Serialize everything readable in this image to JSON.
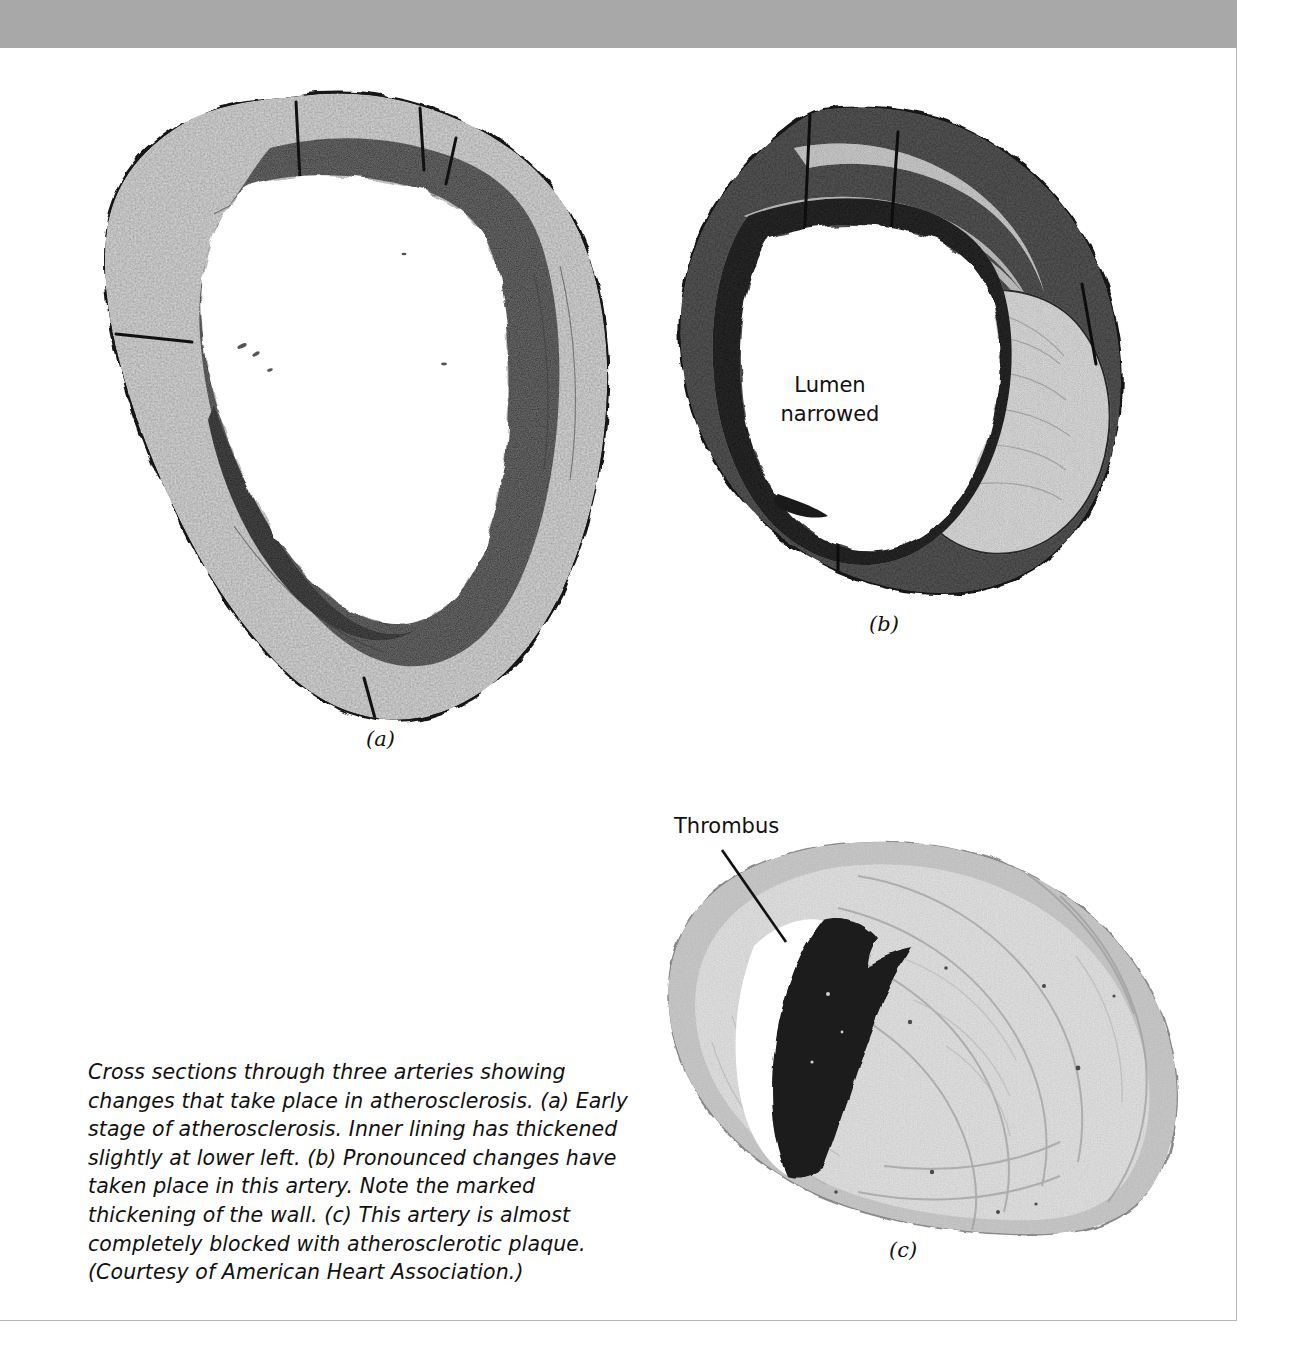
{
  "page": {
    "background_color": "#ffffff",
    "header_band_color": "#a8a8a8",
    "rule_color": "#b9b9b9",
    "text_color": "#111111"
  },
  "figure": {
    "caption": "Cross sections through three arteries showing changes that take place in atherosclerosis. (a) Early stage of atherosclerosis. Inner lining has thickened slightly at lower left. (b) Pronounced changes have taken place in this artery. Note the marked thickening of the wall. (c) This artery is almost completely blocked with atherosclerotic plaque. (Courtesy of American Heart Association.)",
    "panels": [
      {
        "letter": "(a)",
        "description": "Early stage of atherosclerosis; irregular ring of arterial wall with a wide open lumen",
        "annotations": []
      },
      {
        "letter": "(b)",
        "description": "Pronounced atherosclerotic changes; markedly thickened wall with plaque narrowing the lumen",
        "annotations": [
          {
            "name": "lumen-narrowed",
            "text": "Lumen\nnarrowed",
            "has_leader": false
          }
        ]
      },
      {
        "letter": "(c)",
        "description": "Artery almost completely blocked with atherosclerotic plaque and a thrombus",
        "annotations": [
          {
            "name": "thrombus",
            "text": "Thrombus",
            "has_leader": true
          }
        ]
      }
    ]
  },
  "labels": {
    "lumen_narrowed": "Lumen\nnarrowed",
    "thrombus": "Thrombus",
    "letter_a": "(a)",
    "letter_b": "(b)",
    "letter_c": "(c)"
  }
}
